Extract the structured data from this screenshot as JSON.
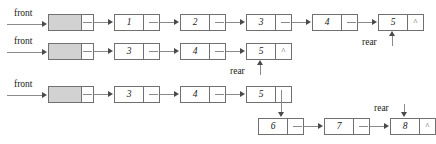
{
  "diagram": {
    "labels": {
      "front": "front",
      "rear": "rear",
      "null": "^"
    },
    "colors": {
      "header_fill": "#d2d2d2",
      "box_border": "#707070",
      "line": "#8a8a8a",
      "text": "#1a1a1a"
    },
    "rows": [
      {
        "id": "row-1",
        "front_label": "front",
        "rear_label": "rear",
        "nodes": [
          {
            "value": "",
            "ptr": "",
            "header": true
          },
          {
            "value": "1",
            "ptr": "",
            "header": false
          },
          {
            "value": "2",
            "ptr": "",
            "header": false
          },
          {
            "value": "3",
            "ptr": "",
            "header": false
          },
          {
            "value": "4",
            "ptr": "",
            "header": false
          },
          {
            "value": "5",
            "ptr": "^",
            "header": false
          }
        ]
      },
      {
        "id": "row-2",
        "front_label": "front",
        "rear_label": "rear",
        "nodes": [
          {
            "value": "",
            "ptr": "",
            "header": true
          },
          {
            "value": "3",
            "ptr": "",
            "header": false
          },
          {
            "value": "4",
            "ptr": "",
            "header": false
          },
          {
            "value": "5",
            "ptr": "^",
            "header": false
          }
        ]
      },
      {
        "id": "row-3",
        "front_label": "front",
        "rear_label": "rear",
        "nodes": [
          {
            "value": "",
            "ptr": "",
            "header": true
          },
          {
            "value": "3",
            "ptr": "",
            "header": false
          },
          {
            "value": "4",
            "ptr": "",
            "header": false
          },
          {
            "value": "5",
            "ptr": "",
            "header": false
          },
          {
            "value": "6",
            "ptr": "",
            "header": false
          },
          {
            "value": "7",
            "ptr": "",
            "header": false
          },
          {
            "value": "8",
            "ptr": "^",
            "header": false
          }
        ]
      }
    ]
  }
}
